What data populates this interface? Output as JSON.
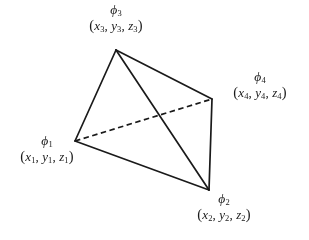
{
  "figure": {
    "type": "tetrahedron-diagram",
    "background_color": "#ffffff",
    "line_color": "#1a1a1a",
    "vertices": [
      {
        "id": "phi1",
        "symbol": "φ",
        "index": "1",
        "coord_open": "(",
        "coord_x": "x",
        "coord_y": "y",
        "coord_z": "z",
        "coord_close": ")",
        "coord_sep1": ", ",
        "coord_sep2": ", ",
        "coord_text": "(x1, y1, z1)",
        "label_text": "φ1",
        "x": 75,
        "y": 141
      },
      {
        "id": "phi2",
        "symbol": "φ",
        "index": "2",
        "coord_open": "(",
        "coord_x": "x",
        "coord_y": "y",
        "coord_z": "z",
        "coord_close": ")",
        "coord_sep1": ", ",
        "coord_sep2": ", ",
        "coord_text": "(x2, y2, z2)",
        "label_text": "φ2",
        "x": 209,
        "y": 190
      },
      {
        "id": "phi3",
        "symbol": "φ",
        "index": "3",
        "coord_open": "(",
        "coord_x": "x",
        "coord_y": "y",
        "coord_z": "z",
        "coord_close": ")",
        "coord_sep1": ", ",
        "coord_sep2": ", ",
        "coord_text": "(x3, y3, z3)",
        "label_text": "φ3",
        "x": 116,
        "y": 50
      },
      {
        "id": "phi4",
        "symbol": "φ",
        "index": "4",
        "coord_open": "(",
        "coord_x": "x",
        "coord_y": "y",
        "coord_z": "z",
        "coord_close": ")",
        "coord_sep1": ", ",
        "coord_sep2": ", ",
        "coord_text": "(x4, y4, z4)",
        "label_text": "φ4",
        "x": 212,
        "y": 99
      }
    ],
    "edges": [
      {
        "from": "phi3",
        "to": "phi1",
        "style": "solid"
      },
      {
        "from": "phi3",
        "to": "phi4",
        "style": "solid"
      },
      {
        "from": "phi3",
        "to": "phi2",
        "style": "solid"
      },
      {
        "from": "phi1",
        "to": "phi2",
        "style": "solid"
      },
      {
        "from": "phi4",
        "to": "phi2",
        "style": "solid"
      },
      {
        "from": "phi1",
        "to": "phi4",
        "style": "dashed"
      }
    ]
  }
}
